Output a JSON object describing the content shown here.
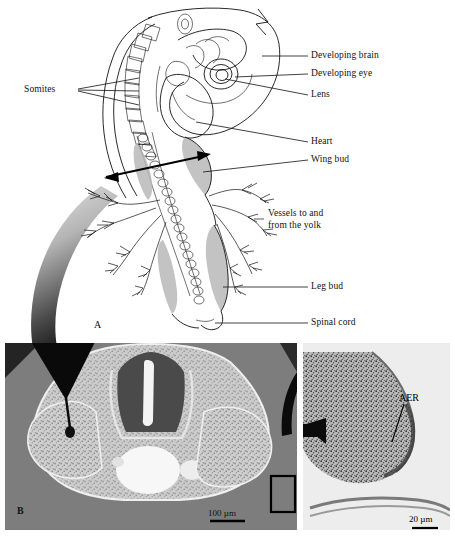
{
  "figure": {
    "type": "scientific-figure",
    "panels": [
      {
        "id": "A",
        "letter": "A",
        "kind": "line-drawing",
        "caption": "Whole chick embryo line drawing with labelled structures"
      },
      {
        "id": "B",
        "letter": "B",
        "kind": "light-micrograph",
        "caption": "Transverse section through embryo at wing bud level"
      },
      {
        "id": "C",
        "letter": "",
        "kind": "light-micrograph",
        "caption": "High magnification of wing bud tip showing AER"
      }
    ]
  },
  "panelA": {
    "letter": "A",
    "labels": [
      {
        "id": "somites",
        "text": "Somites"
      },
      {
        "id": "developing-brain",
        "text": "Developing brain"
      },
      {
        "id": "developing-eye",
        "text": "Developing eye"
      },
      {
        "id": "lens",
        "text": "Lens"
      },
      {
        "id": "heart",
        "text": "Heart"
      },
      {
        "id": "wing-bud",
        "text": "Wing bud"
      },
      {
        "id": "vessels-yolk-line1",
        "text": "Vessels to and"
      },
      {
        "id": "vessels-yolk-line2",
        "text": "from the yolk"
      },
      {
        "id": "leg-bud",
        "text": "Leg bud"
      },
      {
        "id": "spinal-cord",
        "text": "Spinal cord"
      }
    ]
  },
  "panelB": {
    "letter": "B",
    "scale_bar": "100 µm"
  },
  "panelC": {
    "label_aer": "AER",
    "scale_bar": "20 µm"
  },
  "colors": {
    "ink": "#111111",
    "paper": "#ffffff",
    "micrograph_background": "#7d7d7d",
    "micrograph_light": "#d8d8d8",
    "shade_gray": "#b9b9b9",
    "arrow_black": "#000000"
  }
}
